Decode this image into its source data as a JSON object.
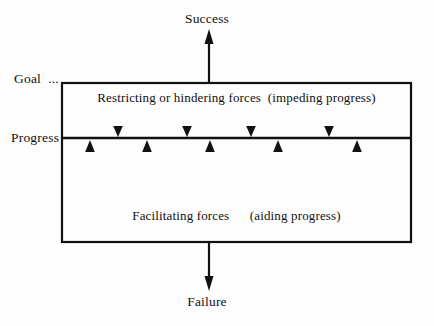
{
  "diagram": {
    "type": "force-field-analysis",
    "title_outcomes": {
      "top": "Success",
      "bottom": "Failure"
    },
    "axis_labels": {
      "goal": "Goal  ...",
      "progress": "Progress"
    },
    "regions": {
      "upper": "Restricting or hindering forces  (impeding progress)",
      "lower": "Facilitating forces      (aiding progress)"
    },
    "colors": {
      "ink": "#111111",
      "background": "#fdfdfd"
    },
    "geometry": {
      "box_left": 62,
      "box_right": 411,
      "box_top": 83,
      "box_bottom": 242,
      "progress_line_y": 138,
      "success_arrow_x": 209,
      "success_arrow_top": 31,
      "failure_arrow_x": 209,
      "failure_arrow_bottom": 289
    },
    "restraining_arrows": {
      "direction": "down",
      "count": 4,
      "x_positions": [
        118,
        187,
        251,
        329
      ]
    },
    "driving_arrows": {
      "direction": "up",
      "count": 5,
      "x_positions": [
        90,
        147,
        210,
        278,
        357
      ]
    }
  }
}
